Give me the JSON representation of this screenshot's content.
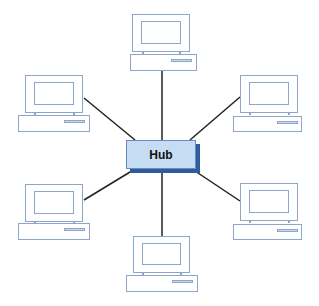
{
  "diagram": {
    "type": "star-topology",
    "hub": {
      "label": "Hub",
      "fill": "#c6dcf2",
      "shadow": "#2e5c9c",
      "border": "#6a8cbb"
    },
    "line_color": "#222222",
    "device_color": "#8fa6cc",
    "computers": [
      {
        "id": "top",
        "position": "top"
      },
      {
        "id": "upper-left",
        "position": "upper-left"
      },
      {
        "id": "upper-right",
        "position": "upper-right"
      },
      {
        "id": "lower-left",
        "position": "lower-left"
      },
      {
        "id": "lower-right",
        "position": "lower-right"
      },
      {
        "id": "bottom",
        "position": "bottom"
      }
    ]
  }
}
